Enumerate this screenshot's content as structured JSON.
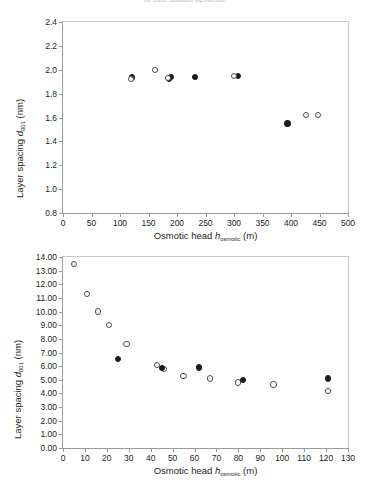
{
  "figure": {
    "top_caption_sliver": "to cure sodium bentonite"
  },
  "chart_data": [
    {
      "id": "top",
      "type": "scatter",
      "title": "",
      "xlabel": "Osmotic head h_osmotic (m)",
      "ylabel": "Layer spacing d_001 (nm)",
      "xlabel_parts": {
        "text_before": "Osmotic head ",
        "italic": "h",
        "subscript": "osmotic",
        "text_after": " (m)"
      },
      "ylabel_parts": {
        "text_before": "Layer spacing ",
        "italic": "d",
        "subscript": "001",
        "text_after": " (nm)"
      },
      "xlim": [
        0,
        500
      ],
      "ylim": [
        0.8,
        2.4
      ],
      "xticks": [
        0,
        50,
        100,
        150,
        200,
        250,
        300,
        350,
        400,
        450,
        500
      ],
      "yticks": [
        "0.8",
        "1.0",
        "1.2",
        "1.4",
        "1.6",
        "1.8",
        "2.0",
        "2.2",
        "2.4"
      ],
      "ytick_values": [
        0.8,
        1.0,
        1.2,
        1.4,
        1.6,
        1.8,
        2.0,
        2.2,
        2.4
      ],
      "grid": false,
      "legend": "none",
      "series": [
        {
          "name": "filled",
          "marker": "filled-circle",
          "points": [
            [
              121,
              1.935
            ],
            [
              186,
              1.925
            ],
            [
              190,
              1.94
            ],
            [
              232,
              1.94
            ],
            [
              307,
              1.945
            ],
            [
              394,
              1.55
            ]
          ]
        },
        {
          "name": "open",
          "marker": "open-circle",
          "points": [
            [
              119,
              1.925
            ],
            [
              161,
              1.995
            ],
            [
              184,
              1.93
            ],
            [
              300,
              1.945
            ],
            [
              427,
              1.62
            ],
            [
              448,
              1.62
            ]
          ]
        }
      ]
    },
    {
      "id": "bottom",
      "type": "scatter",
      "title": "",
      "xlabel": "Osmotic head h_osmotic (m)",
      "ylabel": "Layer spacing d_001 (nm)",
      "xlabel_parts": {
        "text_before": "Osmotic head ",
        "italic": "h",
        "subscript": "osmotic",
        "text_after": " (m)"
      },
      "ylabel_parts": {
        "text_before": "Layer spacing ",
        "italic": "d",
        "subscript": "001",
        "text_after": " (nm)"
      },
      "xlim": [
        0,
        130
      ],
      "ylim": [
        0.0,
        14.0
      ],
      "xticks": [
        0,
        10,
        20,
        30,
        40,
        50,
        60,
        70,
        80,
        90,
        100,
        110,
        120,
        130
      ],
      "yticks": [
        "0.00",
        "1.00",
        "2.00",
        "3.00",
        "4.00",
        "5.00",
        "6.00",
        "7.00",
        "8.00",
        "9.00",
        "10.00",
        "11.00",
        "12.00",
        "13.00",
        "14.00"
      ],
      "ytick_values": [
        0,
        1,
        2,
        3,
        4,
        5,
        6,
        7,
        8,
        9,
        10,
        11,
        12,
        13,
        14
      ],
      "grid": false,
      "legend": "none",
      "series": [
        {
          "name": "open",
          "marker": "open-circle",
          "points": [
            [
              5,
              13.5
            ],
            [
              11,
              11.3
            ],
            [
              16,
              10.0
            ],
            [
              21,
              9.0
            ],
            [
              29,
              7.6
            ],
            [
              43,
              6.1
            ],
            [
              46,
              5.8
            ],
            [
              55,
              5.3
            ],
            [
              67,
              5.1
            ],
            [
              80,
              4.8
            ],
            [
              96,
              4.65
            ],
            [
              121,
              4.2
            ]
          ]
        },
        {
          "name": "filled",
          "marker": "filled-circle",
          "points": [
            [
              25,
              6.5
            ],
            [
              45,
              5.85
            ],
            [
              62,
              5.9
            ],
            [
              82,
              5.0
            ],
            [
              121,
              5.1
            ]
          ]
        }
      ]
    }
  ]
}
